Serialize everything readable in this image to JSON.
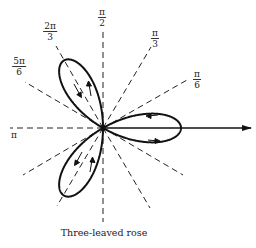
{
  "figure": {
    "caption": "Three-leaved rose",
    "curve": "r = a cos 3θ",
    "colors": {
      "ink": "#111111",
      "background": "#ffffff"
    }
  },
  "axis_labels": {
    "pi_over_2": {
      "num": "π",
      "den": "2"
    },
    "two_pi_over_3": {
      "num": "2π",
      "den": "3"
    },
    "five_pi_over_6": {
      "num": "5π",
      "den": "6"
    },
    "pi_over_3": {
      "num": "π",
      "den": "3"
    },
    "pi_over_6": {
      "num": "π",
      "den": "6"
    },
    "pi": "π"
  },
  "rays_degrees": [
    30,
    60,
    90,
    120,
    150,
    180,
    210,
    240,
    270,
    300,
    330
  ],
  "petals_degrees": [
    0,
    120,
    240
  ]
}
